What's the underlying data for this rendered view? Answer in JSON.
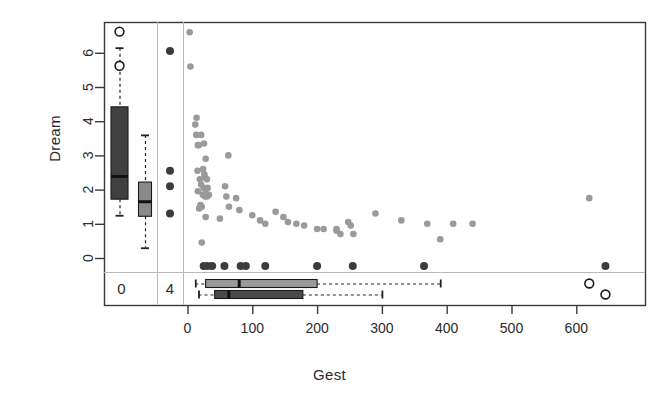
{
  "chart_data": {
    "type": "scatter",
    "title": "",
    "xlabel": "Gest",
    "ylabel": "Dream",
    "xlim": [
      -60,
      680
    ],
    "ylim": [
      -0.75,
      6.9
    ],
    "xticks": [
      0,
      100,
      200,
      300,
      400,
      500,
      600
    ],
    "yticks": [
      0,
      1,
      2,
      3,
      4,
      5,
      6
    ],
    "grid": false,
    "legend": null,
    "point_color": "#9a9a9a",
    "na_point_color": "#3c3c3c",
    "outlier_color": "#ffffff",
    "frame_color": "#3a3a3a",
    "panel_line_color": "#b9b9b9",
    "points": [
      [
        3.3,
        6.6
      ],
      [
        4.5,
        5.6
      ],
      [
        12,
        3.9
      ],
      [
        14,
        4.1
      ],
      [
        13.5,
        3.6
      ],
      [
        21,
        3.6
      ],
      [
        16,
        3.3
      ],
      [
        17.5,
        3.3
      ],
      [
        25.5,
        3.35
      ],
      [
        28,
        2.9
      ],
      [
        63,
        3.0
      ],
      [
        15.5,
        2.55
      ],
      [
        24,
        2.6
      ],
      [
        26,
        2.45
      ],
      [
        27,
        2.35
      ],
      [
        30,
        2.3
      ],
      [
        19,
        2.3
      ],
      [
        21,
        2.15
      ],
      [
        25,
        2.05
      ],
      [
        28,
        2.0
      ],
      [
        31,
        2.05
      ],
      [
        16,
        1.95
      ],
      [
        23.5,
        1.85
      ],
      [
        27,
        1.8
      ],
      [
        30,
        1.8
      ],
      [
        33,
        1.85
      ],
      [
        58,
        2.1
      ],
      [
        60,
        1.8
      ],
      [
        75,
        1.75
      ],
      [
        20,
        1.55
      ],
      [
        22,
        1.5
      ],
      [
        18,
        1.45
      ],
      [
        64,
        1.5
      ],
      [
        80,
        1.4
      ],
      [
        28,
        1.2
      ],
      [
        50,
        1.15
      ],
      [
        100,
        1.25
      ],
      [
        112,
        1.1
      ],
      [
        120,
        1.0
      ],
      [
        136,
        1.35
      ],
      [
        148,
        1.2
      ],
      [
        155,
        1.05
      ],
      [
        168,
        1.0
      ],
      [
        180,
        0.95
      ],
      [
        200,
        0.85
      ],
      [
        210,
        0.85
      ],
      [
        230,
        0.85
      ],
      [
        248,
        1.05
      ],
      [
        252,
        0.95
      ],
      [
        256,
        0.7
      ],
      [
        290,
        1.3
      ],
      [
        330,
        1.1
      ],
      [
        370,
        1.0
      ],
      [
        390,
        0.55
      ],
      [
        410,
        1.0
      ],
      [
        440,
        1.0
      ],
      [
        230,
        0.8
      ],
      [
        236,
        0.7
      ],
      [
        22,
        0.45
      ],
      [
        620,
        1.75
      ]
    ],
    "na_row_points": [
      [
        25,
        -0.4
      ],
      [
        31,
        -0.4
      ],
      [
        38,
        -0.4
      ],
      [
        57,
        -0.4
      ],
      [
        82,
        -0.4
      ],
      [
        90,
        -0.4
      ],
      [
        120,
        -0.4
      ],
      [
        200,
        -0.4
      ],
      [
        255,
        -0.4
      ],
      [
        365,
        -0.4
      ],
      [
        645,
        -0.4
      ]
    ],
    "na_col_points": [
      [
        -38,
        6.05
      ],
      [
        -38,
        2.55
      ],
      [
        -38,
        2.1
      ],
      [
        -38,
        1.3
      ]
    ],
    "na_groups": {
      "x_group_label": "0",
      "y_group_label": "4"
    },
    "marginal_boxplots": {
      "y_margin": [
        {
          "name": "complete",
          "fill": "#404040",
          "q1": 1.72,
          "median": 2.4,
          "q3": 4.42,
          "lower_whisker": 1.25,
          "upper_whisker": 6.15,
          "outliers": [
            6.62,
            5.62
          ]
        },
        {
          "name": "na-group",
          "fill": "#8a8a8a",
          "q1": 1.22,
          "median": 1.66,
          "q3": 2.22,
          "lower_whisker": 0.3,
          "upper_whisker": 3.6,
          "outliers": []
        }
      ],
      "x_margin": [
        {
          "name": "complete",
          "fill": "#9a9a9a",
          "q1": 28,
          "median": 79,
          "q3": 200,
          "lower_whisker": 12,
          "upper_whisker": 390,
          "outliers": [
            620
          ]
        },
        {
          "name": "na-group",
          "fill": "#4a4a4a",
          "q1": 42,
          "median": 63,
          "q3": 178,
          "lower_whisker": 17,
          "upper_whisker": 300,
          "outliers": [
            645
          ]
        }
      ]
    }
  }
}
